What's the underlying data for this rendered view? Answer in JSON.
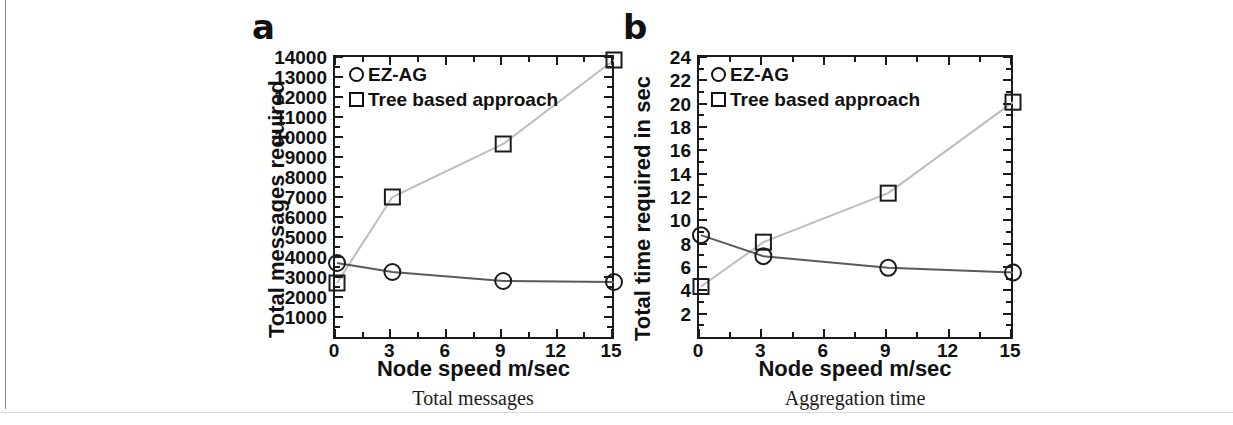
{
  "figure": {
    "panels": [
      {
        "letter": "a",
        "sub_caption": "Total messages"
      },
      {
        "letter": "b",
        "sub_caption": "Aggregation time"
      }
    ]
  },
  "chart_data": [
    {
      "type": "line",
      "title": "Total messages",
      "panel_letter": "a",
      "xlabel": "Node speed m/sec",
      "ylabel": "Total messages required",
      "xlim": [
        0,
        15
      ],
      "ylim": [
        0,
        14000
      ],
      "xticks": [
        0,
        3,
        6,
        9,
        12,
        15
      ],
      "xtick_labels": [
        "0",
        "3",
        "6",
        "9",
        "12",
        "15"
      ],
      "yticks": [
        1000,
        2000,
        3000,
        4000,
        5000,
        6000,
        7000,
        8000,
        9000,
        10000,
        11000,
        12000,
        13000,
        14000
      ],
      "ytick_labels": [
        "1000",
        "2000",
        "3000",
        "4000",
        "5000",
        "6000",
        "7000",
        "8000",
        "9000",
        "10000",
        "11000",
        "12000",
        "13000",
        "14000"
      ],
      "grid": false,
      "legend_position": "top-left",
      "x": [
        0,
        3,
        9,
        15
      ],
      "series": [
        {
          "name": "EZ-AG",
          "marker": "circle",
          "color": "#5a5a5a",
          "values": [
            3800,
            3350,
            2900,
            2850
          ]
        },
        {
          "name": "Tree based approach",
          "marker": "square",
          "color": "#bdbdbd",
          "values": [
            2800,
            7100,
            9750,
            13950
          ]
        }
      ]
    },
    {
      "type": "line",
      "title": "Aggregation time",
      "panel_letter": "b",
      "xlabel": "Node speed m/sec",
      "ylabel": "Total time required in sec",
      "xlim": [
        0,
        15
      ],
      "ylim": [
        0,
        24
      ],
      "xticks": [
        0,
        3,
        6,
        9,
        12,
        15
      ],
      "xtick_labels": [
        "0",
        "3",
        "6",
        "9",
        "12",
        "15"
      ],
      "yticks": [
        2,
        4,
        6,
        8,
        10,
        12,
        14,
        16,
        18,
        20,
        22,
        24
      ],
      "ytick_labels": [
        "2",
        "4",
        "6",
        "8",
        "10",
        "12",
        "14",
        "16",
        "18",
        "20",
        "22",
        "24"
      ],
      "grid": false,
      "legend_position": "top-left",
      "x": [
        0,
        3,
        9,
        15
      ],
      "series": [
        {
          "name": "EZ-AG",
          "marker": "circle",
          "color": "#5a5a5a",
          "values": [
            8.9,
            7.1,
            6.1,
            5.7
          ]
        },
        {
          "name": "Tree based approach",
          "marker": "square",
          "color": "#bdbdbd",
          "values": [
            4.5,
            8.3,
            12.5,
            20.3
          ]
        }
      ]
    }
  ],
  "colors": {
    "axis": "#1b1b1b",
    "text": "#111111",
    "series_ezag": "#5a5a5a",
    "series_tree": "#bdbdbd",
    "page_rule": "#8a8a8a"
  }
}
